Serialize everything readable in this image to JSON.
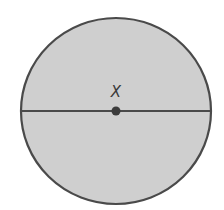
{
  "diagram": {
    "shape": "circle",
    "center_label": "X",
    "colors": {
      "fill": "#cfcfcf",
      "stroke": "#4a4a4a",
      "dot": "#3c3c3c",
      "background": "#ffffff"
    }
  }
}
